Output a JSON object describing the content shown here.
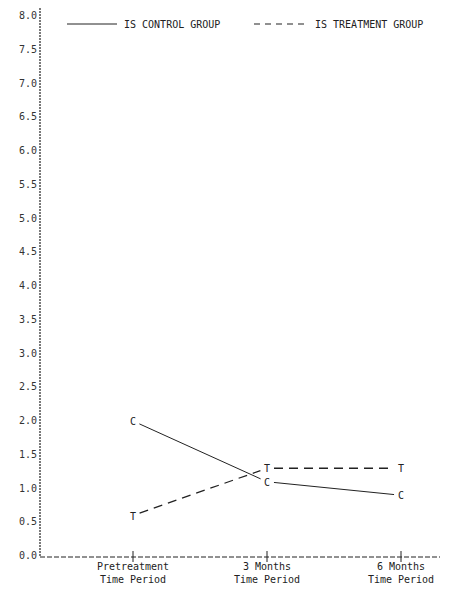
{
  "chart_data": {
    "type": "line",
    "title": "",
    "xlabel": "",
    "ylabel": "",
    "categories": [
      [
        "Pretreatment",
        "Time Period"
      ],
      [
        "3 Months",
        "Time Period"
      ],
      [
        "6 Months",
        "Time Period"
      ]
    ],
    "series": [
      {
        "name": "IS CONTROL GROUP",
        "marker": "C",
        "style": "solid",
        "values": [
          2.0,
          1.1,
          0.9
        ]
      },
      {
        "name": "IS TREATMENT GROUP",
        "marker": "T",
        "style": "dashed",
        "values": [
          0.6,
          1.3,
          1.3
        ]
      }
    ],
    "yticks": [
      "0.0",
      "0.5",
      "1.0",
      "1.5",
      "2.0",
      "2.5",
      "3.0",
      "3.5",
      "4.0",
      "4.5",
      "5.0",
      "5.5",
      "6.0",
      "6.5",
      "7.0",
      "7.5",
      "8.0"
    ],
    "ylim": [
      0,
      8
    ],
    "grid": false,
    "legend": {
      "placement": "top",
      "entries": [
        {
          "label": "IS CONTROL GROUP",
          "style": "solid"
        },
        {
          "label": "IS TREATMENT GROUP",
          "style": "dashed"
        }
      ]
    },
    "colors": {
      "ink": "#222222"
    }
  }
}
